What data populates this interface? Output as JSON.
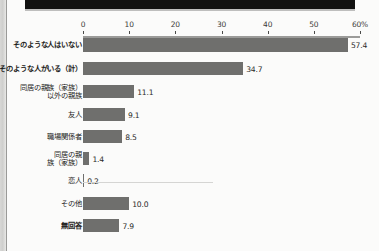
{
  "page": {
    "background_color": "#fbfbfa",
    "header_band_color": "#111110"
  },
  "chart_data": {
    "type": "bar",
    "orientation": "horizontal",
    "title": "",
    "xlabel": "",
    "ylabel": "",
    "xlim": [
      0,
      60
    ],
    "grid": false,
    "legend": "none",
    "bar_color": "#6f6f6d",
    "axis_unit": "%",
    "tick_labels": [
      "0",
      "10",
      "20",
      "30",
      "40",
      "50",
      "60%"
    ],
    "ticks": [
      0,
      10,
      20,
      30,
      40,
      50,
      60
    ],
    "categories": [
      "そのような人はいない",
      "そのような人がいる（計）",
      "同居の親族（家族）\n以外の親族",
      "友人",
      "職場関係者",
      "同居の親\n族（家族）",
      "恋人",
      "その他",
      "無回答"
    ],
    "values": [
      57.4,
      34.7,
      11.1,
      9.1,
      8.5,
      1.4,
      0.2,
      10.0,
      7.9
    ],
    "value_labels": [
      "57.4",
      "34.7",
      "11.1",
      "9.1",
      "8.5",
      "1.4",
      "0.2",
      "10.0",
      "7.9"
    ],
    "bold_categories": [
      "そのような人はいない",
      "そのような人がいる（計）",
      "無回答"
    ]
  }
}
